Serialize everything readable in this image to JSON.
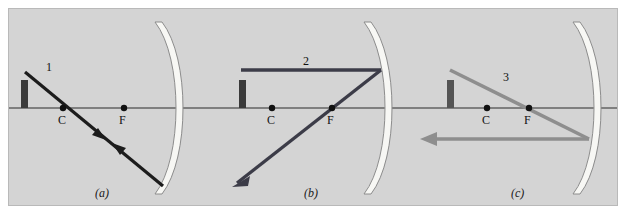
{
  "figure": {
    "background_color": "#d4d4d4",
    "frame_border_color": "#b9b9b9",
    "axis_color": "#2b2b2b",
    "mirror_fill_color": "#f7f7f4",
    "mirror_outline_color": "#8c8c8c",
    "object_color": "#3a3a3a"
  },
  "panels": [
    {
      "id": "a",
      "caption": "(a)",
      "ray_label": "1",
      "ray_color": "#1c1c1c",
      "center_label": "C",
      "focus_label": "F",
      "description": "Ray through C strikes mirror and reflects back along itself"
    },
    {
      "id": "b",
      "caption": "(b)",
      "ray_label": "2",
      "ray_color": "#3c3c48",
      "center_label": "C",
      "focus_label": "F",
      "description": "Ray parallel to axis reflects through F"
    },
    {
      "id": "c",
      "caption": "(c)",
      "ray_label": "3",
      "ray_color": "#8e8e8e",
      "center_label": "C",
      "focus_label": "F",
      "description": "Ray through F reflects parallel to axis"
    }
  ]
}
